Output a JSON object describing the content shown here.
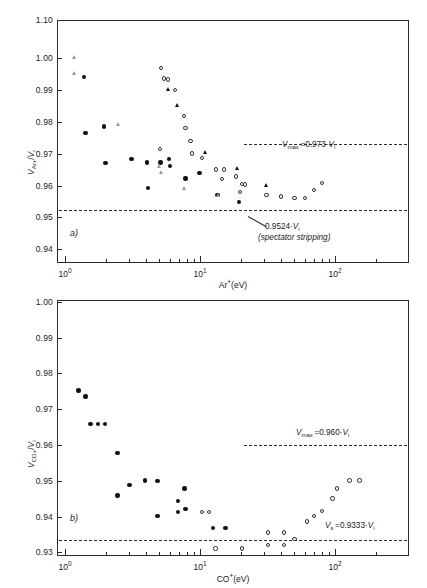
{
  "figure": {
    "panels": [
      {
        "id": "a",
        "letter": "a)",
        "ylabel": "V_Ar+ / V_i",
        "xlabel": "Ar⁺(eV)",
        "yticks": [
          "1.10",
          "1.00",
          "0.99",
          "0.98",
          "0.97",
          "0.96",
          "0.95",
          "0.94"
        ],
        "xticks": [
          "10⁰",
          "10¹",
          "10²"
        ],
        "annotations": [
          {
            "name": "vmax",
            "text": "Vmax = 0.973·Vi",
            "value": 0.973
          },
          {
            "name": "spectator",
            "text": "0.9524·Vi",
            "value": 0.9524
          },
          {
            "name": "spectator-sub",
            "text": "(spectator stripping)"
          }
        ]
      },
      {
        "id": "b",
        "letter": "b)",
        "ylabel": "V_CO+ / V_i",
        "xlabel": "CO⁺(eV)",
        "yticks": [
          "1.00",
          "0.99",
          "0.98",
          "0.97",
          "0.96",
          "0.95",
          "0.94",
          "0.93"
        ],
        "xticks": [
          "10⁰",
          "10¹",
          "10²"
        ],
        "annotations": [
          {
            "name": "vmax",
            "text": "Vmax = 0.960·Vi",
            "value": 0.96
          },
          {
            "name": "vs",
            "text": "Vs = 0.9333·Vi",
            "value": 0.9333
          }
        ]
      }
    ]
  },
  "chart_data": [
    {
      "id": "panel-a",
      "type": "scatter",
      "title": "",
      "xlabel": "Ar+(eV)",
      "ylabel": "V_Ar+ / V_i",
      "xscale": "log",
      "xlim": [
        1.0,
        200.0
      ],
      "ylim": [
        0.94,
        1.0
      ],
      "y_axis_break": {
        "between": [
          1.0,
          1.1
        ],
        "top_tick": 1.1
      },
      "grid": false,
      "legend": "none",
      "reference_lines": [
        {
          "name": "Vmax",
          "y": 0.973,
          "label": "Vmax = 0.973·Vi",
          "style": "dashed"
        },
        {
          "name": "spectator-stripping",
          "y": 0.9524,
          "label": "0.9524·Vi (spectator stripping)",
          "style": "dashed"
        }
      ],
      "series": [
        {
          "name": "filled-circle",
          "marker": "filled-circle",
          "points": [
            [
              1.38,
              0.994
            ],
            [
              1.42,
              0.9765
            ],
            [
              1.95,
              0.9785
            ],
            [
              2.0,
              0.967
            ],
            [
              3.1,
              0.9682
            ],
            [
              4.05,
              0.9672
            ],
            [
              4.1,
              0.9592
            ],
            [
              5.1,
              0.9672
            ],
            [
              5.9,
              0.9683
            ],
            [
              6.0,
              0.966
            ],
            [
              7.8,
              0.9622
            ],
            [
              9.9,
              0.9638
            ],
            [
              13.5,
              0.957
            ],
            [
              19.5,
              0.9548
            ]
          ]
        },
        {
          "name": "open-circle",
          "marker": "open-circle",
          "points": [
            [
              5.15,
              0.9968
            ],
            [
              5.4,
              0.9935
            ],
            [
              5.8,
              0.9932
            ],
            [
              6.5,
              0.99
            ],
            [
              7.6,
              0.9818
            ],
            [
              7.8,
              0.978
            ],
            [
              8.5,
              0.974
            ],
            [
              8.7,
              0.97
            ],
            [
              10.3,
              0.9686
            ],
            [
              5.05,
              0.9715
            ],
            [
              13.2,
              0.965
            ],
            [
              15.0,
              0.965
            ],
            [
              14.5,
              0.962
            ],
            [
              18.5,
              0.9628
            ],
            [
              20.5,
              0.9605
            ],
            [
              21.5,
              0.9603
            ],
            [
              19.8,
              0.958
            ],
            [
              31.0,
              0.957
            ],
            [
              40.0,
              0.9565
            ],
            [
              50.0,
              0.956
            ],
            [
              60.0,
              0.956
            ],
            [
              70.0,
              0.9585
            ],
            [
              80.0,
              0.9608
            ]
          ]
        },
        {
          "name": "filled-triangle",
          "marker": "filled-triangle",
          "points": [
            [
              5.85,
              0.99
            ],
            [
              6.8,
              0.985
            ],
            [
              11.0,
              0.9702
            ],
            [
              19.0,
              0.9652
            ],
            [
              31.5,
              0.9598
            ]
          ]
        },
        {
          "name": "open-triangle",
          "marker": "open-triangle",
          "points": [
            [
              1.18,
              1.0
            ],
            [
              1.18,
              0.995
            ],
            [
              2.5,
              0.979
            ],
            [
              5.05,
              0.966
            ],
            [
              5.2,
              0.964
            ],
            [
              7.7,
              0.959
            ],
            [
              13.8,
              0.9568
            ]
          ]
        }
      ]
    },
    {
      "id": "panel-b",
      "type": "scatter",
      "title": "",
      "xlabel": "CO+(eV)",
      "ylabel": "V_CO+ / V_i",
      "xscale": "log",
      "xlim": [
        1.0,
        200.0
      ],
      "ylim": [
        0.93,
        1.0
      ],
      "grid": false,
      "legend": "none",
      "reference_lines": [
        {
          "name": "Vmax",
          "y": 0.96,
          "label": "Vmax = 0.960·Vi",
          "style": "dashed"
        },
        {
          "name": "Vs",
          "y": 0.9333,
          "label": "Vs = 0.9333·Vi",
          "style": "dashed"
        }
      ],
      "series": [
        {
          "name": "filled-circle",
          "marker": "filled-circle",
          "points": [
            [
              1.26,
              0.9752
            ],
            [
              1.42,
              0.9735
            ],
            [
              1.55,
              0.9658
            ],
            [
              1.75,
              0.9658
            ],
            [
              1.98,
              0.9658
            ],
            [
              2.45,
              0.9578
            ],
            [
              2.45,
              0.9458
            ],
            [
              3.0,
              0.9487
            ],
            [
              3.9,
              0.95
            ],
            [
              4.85,
              0.9498
            ],
            [
              4.85,
              0.94
            ],
            [
              6.9,
              0.9442
            ],
            [
              6.9,
              0.9412
            ],
            [
              7.7,
              0.9478
            ],
            [
              7.8,
              0.942
            ],
            [
              12.5,
              0.9367
            ],
            [
              15.5,
              0.9368
            ]
          ]
        },
        {
          "name": "open-circle",
          "marker": "open-circle",
          "points": [
            [
              10.3,
              0.9412
            ],
            [
              11.7,
              0.9412
            ],
            [
              13.0,
              0.931
            ],
            [
              20.5,
              0.931
            ],
            [
              32.0,
              0.9355
            ],
            [
              32.0,
              0.932
            ],
            [
              42.0,
              0.9355
            ],
            [
              42.0,
              0.932
            ],
            [
              50.0,
              0.9337
            ],
            [
              62.0,
              0.9385
            ],
            [
              70.0,
              0.94
            ],
            [
              80.0,
              0.9415
            ],
            [
              96.0,
              0.945
            ],
            [
              103.0,
              0.9478
            ],
            [
              128.0,
              0.95
            ],
            [
              152.0,
              0.95
            ]
          ]
        }
      ]
    }
  ]
}
